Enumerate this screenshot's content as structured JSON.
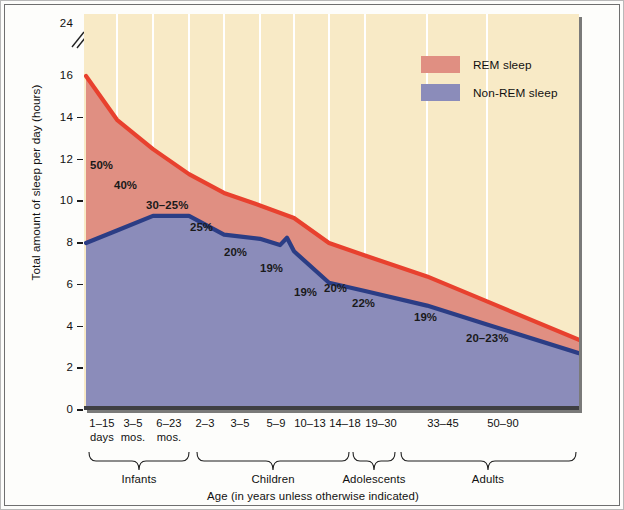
{
  "chart_data": {
    "type": "area",
    "title": "",
    "xlabel": "Age (in years unless otherwise indicated)",
    "ylabel": "Total amount of sleep per day (hours)",
    "ylim": [
      0,
      24
    ],
    "yticks": [
      0,
      2,
      4,
      6,
      8,
      10,
      12,
      14,
      16,
      24
    ],
    "ytick_labels": [
      "0",
      "2",
      "4",
      "6",
      "8",
      "10",
      "12",
      "14",
      "16",
      "24"
    ],
    "axis_break": true,
    "axis_break_note": "y-axis broken between 16 and 24",
    "grid": "vertical white gridlines at each age category",
    "legend": {
      "position": "top-right inside plot",
      "entries": [
        {
          "label": "REM sleep",
          "color": "#e08f82"
        },
        {
          "label": "Non-REM sleep",
          "color": "#8b8cba"
        }
      ]
    },
    "categories": [
      {
        "l1": "1–15",
        "l2": "days"
      },
      {
        "l1": "3–5",
        "l2": "mos."
      },
      {
        "l1": "6–23",
        "l2": "mos."
      },
      {
        "l1": "2–3",
        "l2": ""
      },
      {
        "l1": "3–5",
        "l2": ""
      },
      {
        "l1": "5–9",
        "l2": ""
      },
      {
        "l1": "10–13",
        "l2": ""
      },
      {
        "l1": "14–18",
        "l2": ""
      },
      {
        "l1": "19–30",
        "l2": ""
      },
      {
        "l1": "33–45",
        "l2": ""
      },
      {
        "l1": "50–90",
        "l2": ""
      }
    ],
    "series": [
      {
        "name": "Non-REM sleep",
        "values": [
          8.0,
          8.6,
          9.3,
          9.3,
          8.4,
          8.2,
          7.6,
          6.1,
          5.7,
          5.0,
          4.1
        ]
      },
      {
        "name": "Total sleep (REM + Non-REM)",
        "values": [
          16.0,
          13.9,
          12.5,
          11.3,
          10.4,
          9.8,
          9.2,
          8.0,
          7.4,
          6.4,
          5.2
        ]
      }
    ],
    "rem_percent_annotations": [
      {
        "text": "50%",
        "category": "1–15 days"
      },
      {
        "text": "40%",
        "category": "3–5 mos."
      },
      {
        "text": "30–25%",
        "category": "6–23 mos."
      },
      {
        "text": "25%",
        "category": "2–3"
      },
      {
        "text": "20%",
        "category": "3–5"
      },
      {
        "text": "19%",
        "category": "5–9"
      },
      {
        "text": "19%",
        "category": "10–13"
      },
      {
        "text": "20%",
        "category": "14–18"
      },
      {
        "text": "22%",
        "category": "19–30"
      },
      {
        "text": "19%",
        "category": "33–45"
      },
      {
        "text": "20–23%",
        "category": "50–90"
      }
    ],
    "age_groups": [
      {
        "label": "Infants",
        "covers": "1–15 days to 6–23 mos."
      },
      {
        "label": "Children",
        "covers": "2–3 to 10–13"
      },
      {
        "label": "Adolescents",
        "covers": "14–18"
      },
      {
        "label": "Adults",
        "covers": "19–30 to 50–90"
      }
    ],
    "colors": {
      "rem_fill": "#e08f82",
      "rem_line": "#e8412e",
      "nonrem_fill": "#8b8cba",
      "nonrem_line": "#2b3d85",
      "background": "#f8eac6",
      "gridline": "#ffffff"
    }
  }
}
